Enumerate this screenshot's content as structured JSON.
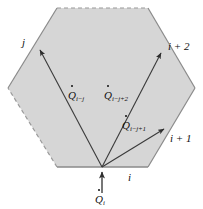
{
  "figure": {
    "name": "hexagonal-enclosure-radiation-diagram",
    "type": "diagram",
    "width": 203,
    "height": 209,
    "colors": {
      "background": "#ffffff",
      "hexagon_fill": "#d6d6d6",
      "hexagon_stroke": "#8a8a8a",
      "arrow_stroke": "#3a3a3a",
      "text": "#101010"
    },
    "shape": {
      "kind": "hexagon",
      "vertices": [
        {
          "name": "top-left",
          "x": 57,
          "y": 8
        },
        {
          "name": "top-right",
          "x": 148,
          "y": 8
        },
        {
          "name": "right",
          "x": 195,
          "y": 88
        },
        {
          "name": "bottom-right",
          "x": 148,
          "y": 167
        },
        {
          "name": "bottom-left",
          "x": 57,
          "y": 167
        },
        {
          "name": "left",
          "x": 8,
          "y": 88
        }
      ],
      "edges": [
        {
          "from": "top-left",
          "to": "top-right",
          "style": "dashed"
        },
        {
          "from": "top-right",
          "to": "right",
          "style": "solid"
        },
        {
          "from": "right",
          "to": "bottom-right",
          "style": "solid"
        },
        {
          "from": "bottom-right",
          "to": "bottom-left",
          "style": "solid"
        },
        {
          "from": "bottom-left",
          "to": "left",
          "style": "dashed"
        },
        {
          "from": "left",
          "to": "top-left",
          "style": "solid"
        }
      ]
    },
    "origin": {
      "name": "surface-i-vertex",
      "x": 102,
      "y": 167
    },
    "arrows": [
      {
        "name": "flux-to-j",
        "from": {
          "x": 102,
          "y": 167
        },
        "to": {
          "x": 38,
          "y": 48
        },
        "target_label": "j",
        "flux_label_base": "Q",
        "flux_label_sub": "i−j"
      },
      {
        "name": "flux-to-i-plus-2",
        "from": {
          "x": 102,
          "y": 167
        },
        "to": {
          "x": 163,
          "y": 51
        },
        "target_label": "i + 2",
        "flux_label_base": "Q",
        "flux_label_sub": "i−j+2"
      },
      {
        "name": "flux-to-i-plus-1",
        "from": {
          "x": 102,
          "y": 167
        },
        "to": {
          "x": 166,
          "y": 128
        },
        "target_label": "i + 1",
        "flux_label_base": "Q",
        "flux_label_sub": "i−j+1"
      },
      {
        "name": "incident-flux-i",
        "from": {
          "x": 102,
          "y": 192
        },
        "to": {
          "x": 102,
          "y": 170
        },
        "target_label": "",
        "flux_label_base": "Q",
        "flux_label_sub": "i"
      }
    ],
    "labels": {
      "j": "j",
      "i_plus_2": "i + 2",
      "i_plus_1": "i + 1",
      "i": "i",
      "q_i_minus_j_base": "Q",
      "q_i_minus_j_sub": "i−j",
      "q_i_minus_j_plus_2_base": "Q",
      "q_i_minus_j_plus_2_sub": "i−j+2",
      "q_i_minus_j_plus_1_base": "Q",
      "q_i_minus_j_plus_1_sub": "i−j+1",
      "q_i_base": "Q",
      "q_i_sub": "i"
    }
  }
}
